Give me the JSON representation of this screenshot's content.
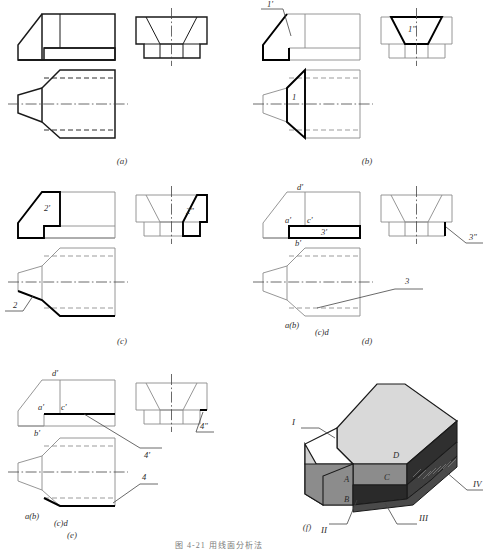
{
  "figure": {
    "caption_bottom": "图 4-21  用线面分析法",
    "panels": [
      {
        "id": "a",
        "caption": "(a)",
        "labels": [],
        "description": "三视图 - 无标注"
      },
      {
        "id": "b",
        "caption": "(b)",
        "labels": [
          {
            "text": "1'",
            "view": "front"
          },
          {
            "text": "1\"",
            "view": "side"
          },
          {
            "text": "1",
            "view": "top"
          }
        ]
      },
      {
        "id": "c",
        "caption": "(c)",
        "labels": [
          {
            "text": "2'",
            "view": "front"
          },
          {
            "text": "2\"",
            "view": "side"
          },
          {
            "text": "2",
            "view": "top"
          }
        ]
      },
      {
        "id": "d",
        "caption": "(d)",
        "labels": [
          {
            "text": "d'",
            "view": "front"
          },
          {
            "text": "a'",
            "view": "front"
          },
          {
            "text": "c'",
            "view": "front"
          },
          {
            "text": "3'",
            "view": "front"
          },
          {
            "text": "3\"",
            "view": "side"
          },
          {
            "text": "b'",
            "view": "top"
          },
          {
            "text": "a(b)",
            "view": "top"
          },
          {
            "text": "(c)d",
            "view": "top"
          },
          {
            "text": "3",
            "view": "top"
          }
        ]
      },
      {
        "id": "e",
        "caption": "(e)",
        "labels": [
          {
            "text": "d'",
            "view": "front"
          },
          {
            "text": "a'",
            "view": "front"
          },
          {
            "text": "c'",
            "view": "front"
          },
          {
            "text": "b'",
            "view": "front"
          },
          {
            "text": "4'",
            "view": "front"
          },
          {
            "text": "4\"",
            "view": "side"
          },
          {
            "text": "a(b)",
            "view": "top"
          },
          {
            "text": "(c)d",
            "view": "top"
          },
          {
            "text": "4",
            "view": "top"
          }
        ]
      },
      {
        "id": "f",
        "caption": "(f)",
        "labels": [
          {
            "text": "I",
            "kind": "roman"
          },
          {
            "text": "II",
            "kind": "roman"
          },
          {
            "text": "III",
            "kind": "roman"
          },
          {
            "text": "IV",
            "kind": "roman"
          },
          {
            "text": "A",
            "kind": "vertex"
          },
          {
            "text": "B",
            "kind": "vertex"
          },
          {
            "text": "C",
            "kind": "vertex"
          },
          {
            "text": "D",
            "kind": "vertex"
          }
        ]
      }
    ]
  },
  "colors": {
    "line": "#1a1a1a",
    "thin": "#555555",
    "highlight": "#000000",
    "iso_top": "#d9d9d9",
    "iso_front": "#8c8c8c",
    "iso_dark": "#3a3a3a",
    "iso_light": "#ffffff",
    "iso_mid": "#b5b5b5",
    "caption": "#3a3a3a"
  }
}
